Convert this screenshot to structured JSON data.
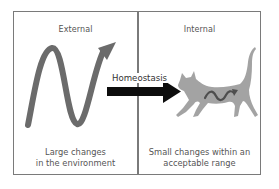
{
  "diagram": {
    "title": "Homeostasis",
    "panels": [
      {
        "id": "external",
        "title": "External",
        "caption_lines": [
          "Large changes",
          "in the environment"
        ],
        "graphic": "large-amplitude-sine-wave-arrow"
      },
      {
        "id": "internal",
        "title": "Internal",
        "caption_lines": [
          "Small changes within an",
          "acceptable range"
        ],
        "graphic": "cat-with-small-wave"
      }
    ],
    "arrow": {
      "label": "Homeostasis",
      "direction": "external-to-internal"
    },
    "colors": {
      "frame": "#7a7a7a",
      "wave": "#6b6b6b",
      "arrow": "#0d0d0d",
      "cat": "#a3a3a3",
      "cat_wave": "#4e4e4e",
      "text": "#555555"
    }
  }
}
